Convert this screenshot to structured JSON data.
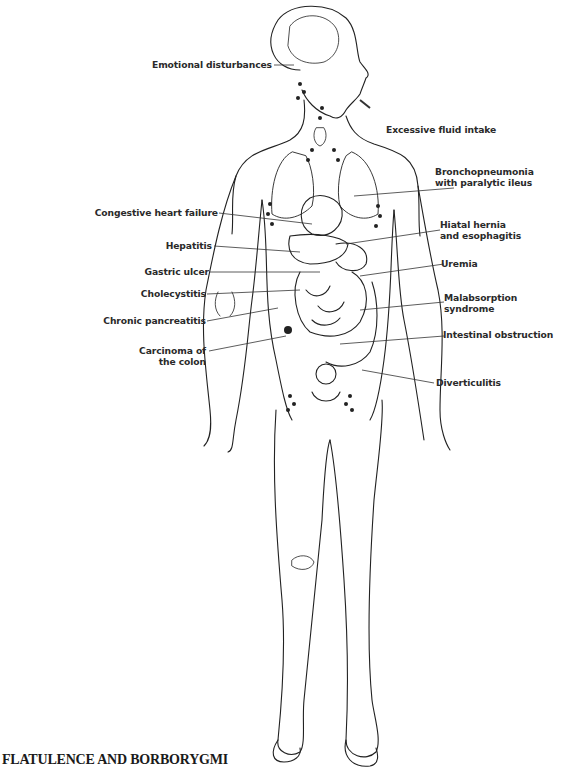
{
  "figure": {
    "title": "FLATULENCE AND BORBORYGMI",
    "labels_left": [
      {
        "id": "emotional",
        "text": "Emotional disturbances"
      },
      {
        "id": "chf",
        "text": "Congestive heart failure"
      },
      {
        "id": "hepatitis",
        "text": "Hepatitis"
      },
      {
        "id": "gastric",
        "text": "Gastric ulcer"
      },
      {
        "id": "cholecystitis",
        "text": "Cholecystitis"
      },
      {
        "id": "pancreatitis",
        "text": "Chronic pancreatitis"
      },
      {
        "id": "carcinoma",
        "line1": "Carcinoma of",
        "line2": "the colon"
      }
    ],
    "labels_right": [
      {
        "id": "fluid",
        "text": "Excessive fluid intake"
      },
      {
        "id": "broncho",
        "line1": "Bronchopneumonia",
        "line2": "with paralytic ileus"
      },
      {
        "id": "hiatal",
        "line1": "Hiatal hernia",
        "line2": "and esophagitis"
      },
      {
        "id": "uremia",
        "text": "Uremia"
      },
      {
        "id": "malabsorption",
        "line1": "Malabsorption",
        "line2": "syndrome"
      },
      {
        "id": "obstruction",
        "text": "Intestinal obstruction"
      },
      {
        "id": "diverticulitis",
        "text": "Diverticulitis"
      }
    ],
    "colors": {
      "ink": "#2a2a2a",
      "background": "#ffffff"
    }
  }
}
